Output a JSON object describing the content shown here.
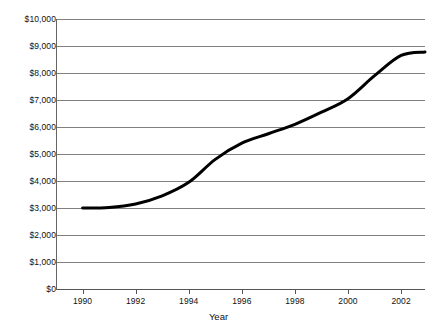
{
  "chart_data": {
    "type": "line",
    "title": "",
    "subtitle": "",
    "xlabel": "Year",
    "ylabel": "",
    "x": [
      1990,
      1991,
      1992,
      1993,
      1994,
      1995,
      1996,
      1997,
      1998,
      1999,
      2000,
      2001,
      2002,
      2002.9
    ],
    "values": [
      3000,
      3020,
      3150,
      3450,
      3950,
      4800,
      5400,
      5750,
      6100,
      6550,
      7050,
      7900,
      8650,
      8780
    ],
    "series": [
      {
        "name": "value",
        "values": [
          3000,
          3020,
          3150,
          3450,
          3950,
          4800,
          5400,
          5750,
          6100,
          6550,
          7050,
          7900,
          8650,
          8780
        ]
      }
    ],
    "xlim": [
      1989.0,
      2002.9
    ],
    "ylim": [
      0,
      10000
    ],
    "x_tick_values": [
      1990,
      1992,
      1994,
      1996,
      1998,
      2000,
      2002
    ],
    "x_tick_labels": [
      "1990",
      "1992",
      "1994",
      "1996",
      "1998",
      "2000",
      "2002"
    ],
    "y_tick_values": [
      0,
      1000,
      2000,
      3000,
      4000,
      5000,
      6000,
      7000,
      8000,
      9000,
      10000
    ],
    "y_tick_labels": [
      "$0",
      "$1,000",
      "$2,000",
      "$3,000",
      "$4,000",
      "$5,000",
      "$6,000",
      "$7,000",
      "$8,000",
      "$9,000",
      "$10,000"
    ],
    "grid": true,
    "grid_axis": "y",
    "legend": false,
    "legend_position": "none",
    "line_color": "#000000",
    "line_width": 3,
    "grid_color": "#808080",
    "background_color": "#ffffff"
  }
}
